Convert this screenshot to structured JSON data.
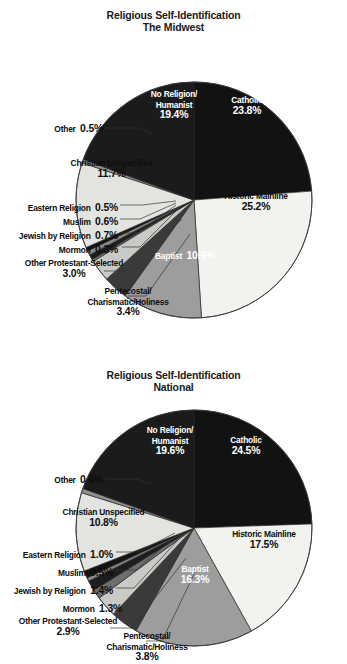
{
  "document": {
    "type": "two-pie-chart-figure",
    "background": "#ffffff"
  },
  "charts": [
    {
      "id": "midwest",
      "title_line1": "Religious Self-Identification",
      "title_line2": "The Midwest",
      "labels": {
        "catholic_name": "Catholic",
        "catholic_pct": "23.8%",
        "historic_name": "Historic Mainline",
        "historic_pct": "25.2%",
        "baptist_name": "Baptist",
        "baptist_pct": "10.9%",
        "pentecostal_name1": "Pentecostal/",
        "pentecostal_name2": "Charismatic/Holiness",
        "pentecostal_pct": "3.4%",
        "otherprot_name": "Other Protestant-Selected",
        "otherprot_pct": "3.0%",
        "mormon_name": "Mormon",
        "mormon_pct": "0.3%",
        "jewish_name": "Jewish by Religion",
        "jewish_pct": "0.7%",
        "muslim_name": "Muslim",
        "muslim_pct": "0.6%",
        "eastern_name": "Eastern Religion",
        "eastern_pct": "0.5%",
        "christian_name": "Christian Unspecified",
        "christian_pct": "11.7%",
        "other_name": "Other",
        "other_pct": "0.5%",
        "noreligion_name1": "No Religion/",
        "noreligion_name2": "Humanist",
        "noreligion_pct": "19.4%"
      }
    },
    {
      "id": "national",
      "title_line1": "Religious Self-Identification",
      "title_line2": "National",
      "labels": {
        "catholic_name": "Catholic",
        "catholic_pct": "24.5%",
        "historic_name": "Historic Mainline",
        "historic_pct": "17.5%",
        "baptist_name": "Baptist",
        "baptist_pct": "16.3%",
        "pentecostal_name1": "Pentecostal/",
        "pentecostal_name2": "Charismatic/Holiness",
        "pentecostal_pct": "3.8%",
        "otherprot_name": "Other Protestant-Selected",
        "otherprot_pct": "2.9%",
        "mormon_name": "Mormon",
        "mormon_pct": "1.3%",
        "jewish_name": "Jewish by Religion",
        "jewish_pct": "1.4%",
        "muslim_name": "Muslim",
        "muslim_pct": "0.5%",
        "eastern_name": "Eastern Religion",
        "eastern_pct": "1.0%",
        "christian_name": "Christian Unspecified",
        "christian_pct": "10.8%",
        "other_name": "Other",
        "other_pct": "0.6%",
        "noreligion_name1": "No Religion/",
        "noreligion_name2": "Humanist",
        "noreligion_pct": "19.6%"
      }
    }
  ],
  "chart_data": [
    {
      "type": "pie",
      "title": "Religious Self-Identification — The Midwest",
      "subtitle": "The Midwest",
      "start_angle_deg": 0,
      "direction": "clockwise",
      "units": "percent",
      "legend": "none (direct slice labels with leader lines)",
      "categories": [
        "Catholic",
        "Historic Mainline",
        "Baptist",
        "Pentecostal/Charismatic/Holiness",
        "Other Protestant-Selected",
        "Mormon",
        "Jewish by Religion",
        "Muslim",
        "Eastern Religion",
        "Christian Unspecified",
        "Other",
        "No Religion/Humanist"
      ],
      "values": [
        23.8,
        25.2,
        10.9,
        3.4,
        3.0,
        0.3,
        0.7,
        0.6,
        0.5,
        11.7,
        0.5,
        19.4
      ],
      "colors": [
        "#121212",
        "#f2f2ee",
        "#9d9d9d",
        "#3a3a3a",
        "#c9c9c5",
        "#6e6e6e",
        "#1d1d1d",
        "#8a8a8a",
        "#141414",
        "#e3e3df",
        "#8f8f8f",
        "#1b1b1b"
      ]
    },
    {
      "type": "pie",
      "title": "Religious Self-Identification — National",
      "subtitle": "National",
      "start_angle_deg": 0,
      "direction": "clockwise",
      "units": "percent",
      "legend": "none (direct slice labels with leader lines)",
      "categories": [
        "Catholic",
        "Historic Mainline",
        "Baptist",
        "Pentecostal/Charismatic/Holiness",
        "Other Protestant-Selected",
        "Mormon",
        "Jewish by Religion",
        "Muslim",
        "Eastern Religion",
        "Christian Unspecified",
        "Other",
        "No Religion/Humanist"
      ],
      "values": [
        24.5,
        17.5,
        16.3,
        3.8,
        2.9,
        1.3,
        1.4,
        0.5,
        1.0,
        10.8,
        0.6,
        19.6
      ],
      "colors": [
        "#121212",
        "#f2f2ee",
        "#9d9d9d",
        "#3a3a3a",
        "#c9c9c5",
        "#6e6e6e",
        "#1d1d1d",
        "#8a8a8a",
        "#141414",
        "#e3e3df",
        "#8f8f8f",
        "#1b1b1b"
      ]
    }
  ]
}
